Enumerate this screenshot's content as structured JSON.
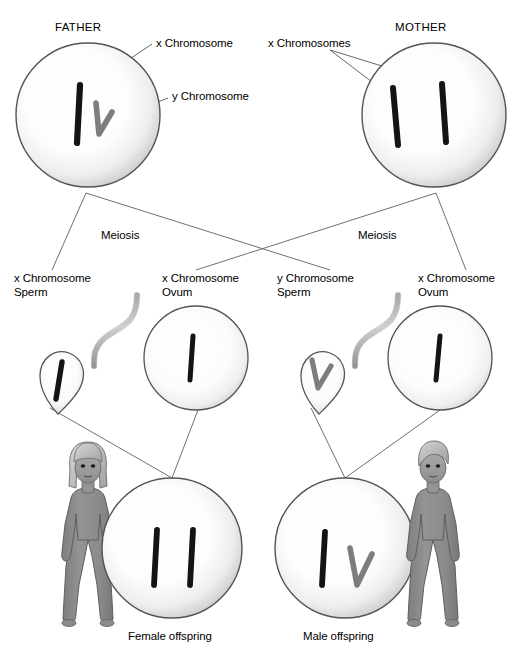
{
  "diagram": {
    "type": "biology-inheritance-diagram",
    "colors": {
      "background": "#ffffff",
      "cell_outline": "#4d4d4d",
      "cell_fill_light": "#ffffff",
      "cell_fill_shadow": "#b5b5b5",
      "x_chromosome": "#111111",
      "y_chromosome": "#7d7d7d",
      "leader_line": "#555555",
      "figure_body": "#8c8c8c",
      "figure_outline": "#5a5a5a",
      "text": "#000000"
    }
  },
  "parents": {
    "father": {
      "label": "FATHER",
      "chromosomes": [
        {
          "type": "x",
          "label": "x Chromosome"
        },
        {
          "type": "y",
          "label": "y Chromosome"
        }
      ],
      "annotations": {
        "x_label": "x Chromosome",
        "y_label": "y Chromosome"
      }
    },
    "mother": {
      "label": "MOTHER",
      "chromosomes": [
        {
          "type": "x",
          "label": "x Chromosomes"
        },
        {
          "type": "x",
          "label": "x Chromosomes"
        }
      ],
      "annotations": {
        "x_label": "x Chromosomes"
      }
    }
  },
  "process": {
    "father_meiosis_label": "Meiosis",
    "mother_meiosis_label": "Meiosis"
  },
  "gametes": [
    {
      "id": "x-sperm",
      "kind": "sperm",
      "chromosome": "x",
      "label_line1": "x Chromosome",
      "label_line2": "Sperm"
    },
    {
      "id": "x-ovum-left",
      "kind": "ovum",
      "chromosome": "x",
      "label_line1": "x Chromosome",
      "label_line2": "Ovum"
    },
    {
      "id": "y-sperm",
      "kind": "sperm",
      "chromosome": "y",
      "label_line1": "y Chromosome",
      "label_line2": "Sperm"
    },
    {
      "id": "x-ovum-right",
      "kind": "ovum",
      "chromosome": "x",
      "label_line1": "x Chromosome",
      "label_line2": "Ovum"
    }
  ],
  "offspring": [
    {
      "id": "female-offspring",
      "label": "Female offspring",
      "chromosomes": [
        "x",
        "x"
      ],
      "figure": "girl-figure",
      "figure_side": "left"
    },
    {
      "id": "male-offspring",
      "label": "Male offspring",
      "chromosomes": [
        "x",
        "y"
      ],
      "figure": "boy-figure",
      "figure_side": "right"
    }
  ]
}
